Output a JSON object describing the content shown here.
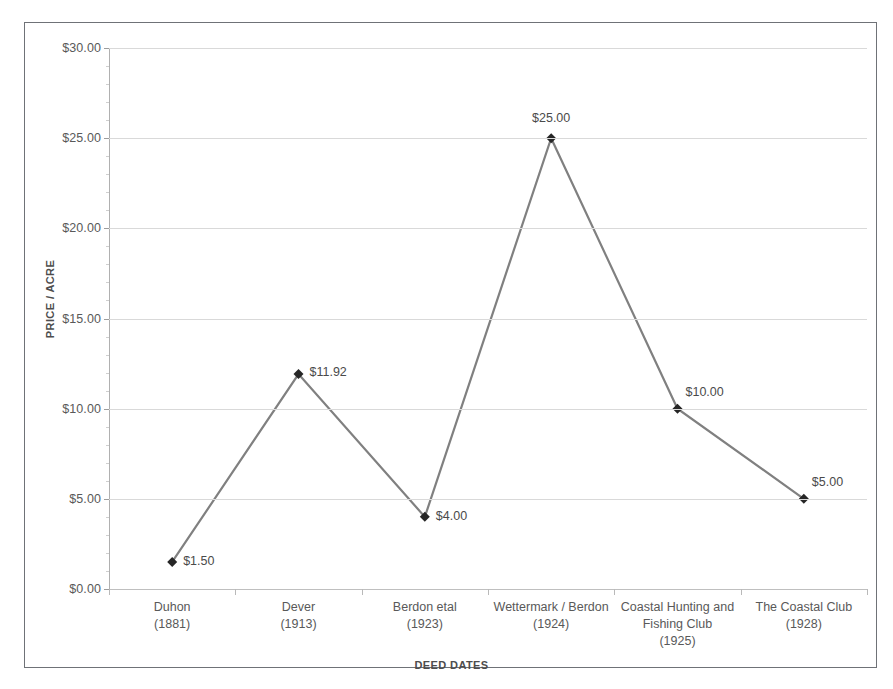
{
  "chart_data": {
    "type": "line",
    "title": "",
    "xlabel": "DEED DATES",
    "ylabel": "PRICE / ACRE",
    "categories": [
      "Duhon\n(1881)",
      "Dever\n(1913)",
      "Berdon etal\n(1923)",
      "Wettermark / Berdon\n(1924)",
      "Coastal Hunting and Fishing Club\n(1925)",
      "The Coastal Club\n(1928)"
    ],
    "category_names": [
      "Duhon",
      "Dever",
      "Berdon etal",
      "Wettermark / Berdon",
      "Coastal Hunting and Fishing Club",
      "The Coastal Club"
    ],
    "category_years": [
      "(1881)",
      "(1913)",
      "(1923)",
      "(1924)",
      "(1925)",
      "(1928)"
    ],
    "values": [
      1.5,
      11.92,
      4.0,
      25.0,
      10.0,
      5.0
    ],
    "data_labels": [
      "$1.50",
      "$11.92",
      "$4.00",
      "$25.00",
      "$10.00",
      "$5.00"
    ],
    "ylim": [
      0,
      30
    ],
    "ytick_values": [
      0,
      5,
      10,
      15,
      20,
      25,
      30
    ],
    "ytick_labels": [
      "$0.00",
      "$5.00",
      "$10.00",
      "$15.00",
      "$20.00",
      "$25.00",
      "$30.00"
    ],
    "grid": true,
    "legend": false,
    "line_color": "#808080",
    "marker_color": "#262626",
    "marker_shape": "diamond",
    "gridline_color": "#d9d9d9",
    "text_color": "#595959",
    "border_color": "#6f7277",
    "background": "#ffffff"
  }
}
